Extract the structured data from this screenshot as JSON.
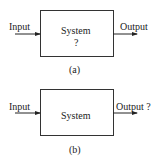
{
  "diagrams": [
    {
      "caption": "(a)",
      "input_label": "Input",
      "system_label": "System",
      "system_sub": "?",
      "output_label": "Output"
    },
    {
      "caption": "(b)",
      "input_label": "Input",
      "system_label": "System",
      "output_label": "Output ?"
    }
  ]
}
